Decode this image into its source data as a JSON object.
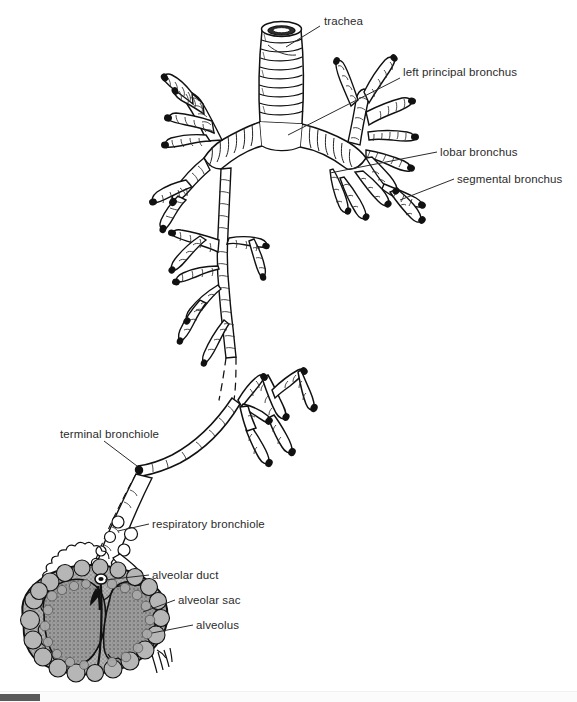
{
  "figure": {
    "background_color": "#ffffff",
    "ink_color": "#111111",
    "tissue_fill": "#9a9a9a",
    "label_color": "#2b2b2b"
  },
  "labels": [
    {
      "id": "trachea",
      "text": "trachea",
      "x": 324,
      "y": 22
    },
    {
      "id": "left-principal-bronchus",
      "text": "left principal bronchus",
      "x": 403,
      "y": 73
    },
    {
      "id": "lobar-bronchus",
      "text": "lobar bronchus",
      "x": 440,
      "y": 147
    },
    {
      "id": "segmental-bronchus",
      "text": "segmental bronchus",
      "x": 457,
      "y": 174
    },
    {
      "id": "terminal-bronchiole",
      "text": "terminal bronchiole",
      "x": 60,
      "y": 428
    },
    {
      "id": "respiratory-bronchiole",
      "text": "respiratory bronchiole",
      "x": 152,
      "y": 519
    },
    {
      "id": "alveolar-duct",
      "text": "alveolar duct",
      "x": 152,
      "y": 570
    },
    {
      "id": "alveolar-sac",
      "text": "alveolar sac",
      "x": 178,
      "y": 595
    },
    {
      "id": "alveolus",
      "text": "alveolus",
      "x": 196,
      "y": 620
    }
  ],
  "scrollbar": {
    "orientation": "horizontal",
    "thumb_color": "#5a5a5a",
    "track_color": "#fbfbfb",
    "thumb_left": 0,
    "thumb_width": 40
  }
}
